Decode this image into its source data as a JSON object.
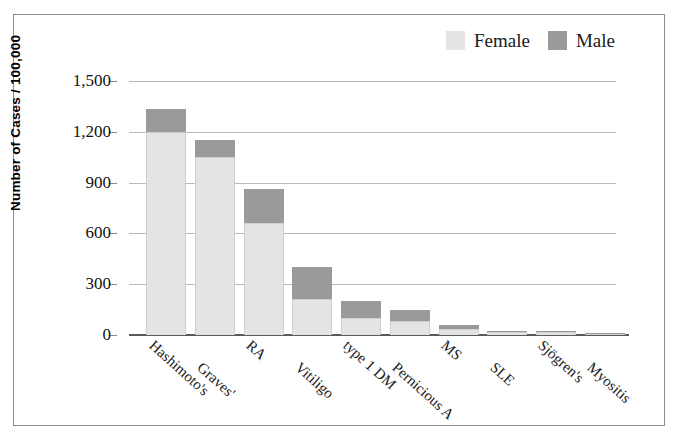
{
  "chart_data": {
    "type": "bar",
    "subtype": "stacked-vertical",
    "title": "",
    "xlabel": "",
    "ylabel": "Number of Cases / 100,000",
    "ylim": [
      0,
      1500
    ],
    "yticks": [
      0,
      300,
      600,
      900,
      1200,
      1500
    ],
    "ytick_labels": [
      "0",
      "300",
      "600",
      "900",
      "1,200",
      "1,500"
    ],
    "grid": true,
    "legend_position": "top-right",
    "categories": [
      "Hashimoto's",
      "Graves'",
      "RA",
      "Vitiligo",
      "type 1 DM",
      "Pernicious A",
      "MS",
      "SLE",
      "Sjögren's",
      "Myositis"
    ],
    "series": [
      {
        "name": "Female",
        "color": "#e4e4e4",
        "values": [
          1200,
          1050,
          660,
          215,
          100,
          80,
          35,
          18,
          15,
          5
        ]
      },
      {
        "name": "Male",
        "color": "#9a9a9a",
        "values": [
          135,
          100,
          205,
          185,
          100,
          65,
          25,
          8,
          5,
          3
        ]
      }
    ],
    "totals": [
      1335,
      1150,
      865,
      400,
      200,
      145,
      60,
      26,
      20,
      8
    ]
  },
  "legend": {
    "items": [
      {
        "label": "Female",
        "color": "#e4e4e4"
      },
      {
        "label": "Male",
        "color": "#9a9a9a"
      }
    ]
  },
  "axes": {
    "y_title": "Number of Cases / 100,000"
  }
}
